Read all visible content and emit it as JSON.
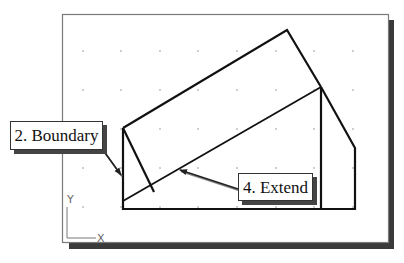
{
  "viewport": {
    "frame": {
      "x": 62,
      "y": 14,
      "width": 326,
      "height": 228
    },
    "frame_color": "#7a7a7a",
    "shadow_color": "#3a3a3a",
    "background": "#ffffff"
  },
  "grid": {
    "dot_color": "#b8b8b8",
    "x_positions": [
      83,
      121,
      160,
      198,
      237,
      276,
      314,
      353
    ],
    "y_positions": [
      51,
      90,
      129,
      168,
      207
    ]
  },
  "ucs_icon": {
    "y_label": "Y",
    "x_label": "X"
  },
  "geometry": {
    "stroke_color": "#111111",
    "base_outline": [
      [
        123,
        128
      ],
      [
        123,
        209
      ],
      [
        355,
        209
      ],
      [
        355,
        148
      ],
      [
        321,
        87
      ]
    ],
    "rectangle": [
      [
        123,
        128
      ],
      [
        287,
        30
      ],
      [
        321,
        87
      ]
    ],
    "inner_line": [
      [
        123,
        128
      ],
      [
        154,
        192
      ]
    ],
    "extend_diagonal": [
      [
        123,
        201
      ],
      [
        321,
        87
      ]
    ],
    "vertical_line": [
      [
        321,
        87
      ],
      [
        321,
        209
      ]
    ]
  },
  "callouts": [
    {
      "label": "2. Boundary",
      "box": {
        "x": 10,
        "y": 121,
        "width": 93,
        "height": 29
      },
      "arrow_from": [
        103,
        150
      ],
      "arrow_to": [
        121,
        175
      ]
    },
    {
      "label": "4. Extend",
      "box": {
        "x": 238,
        "y": 173,
        "width": 75,
        "height": 28
      },
      "arrow_from": [
        238,
        189
      ],
      "arrow_to": [
        180,
        170
      ]
    }
  ]
}
